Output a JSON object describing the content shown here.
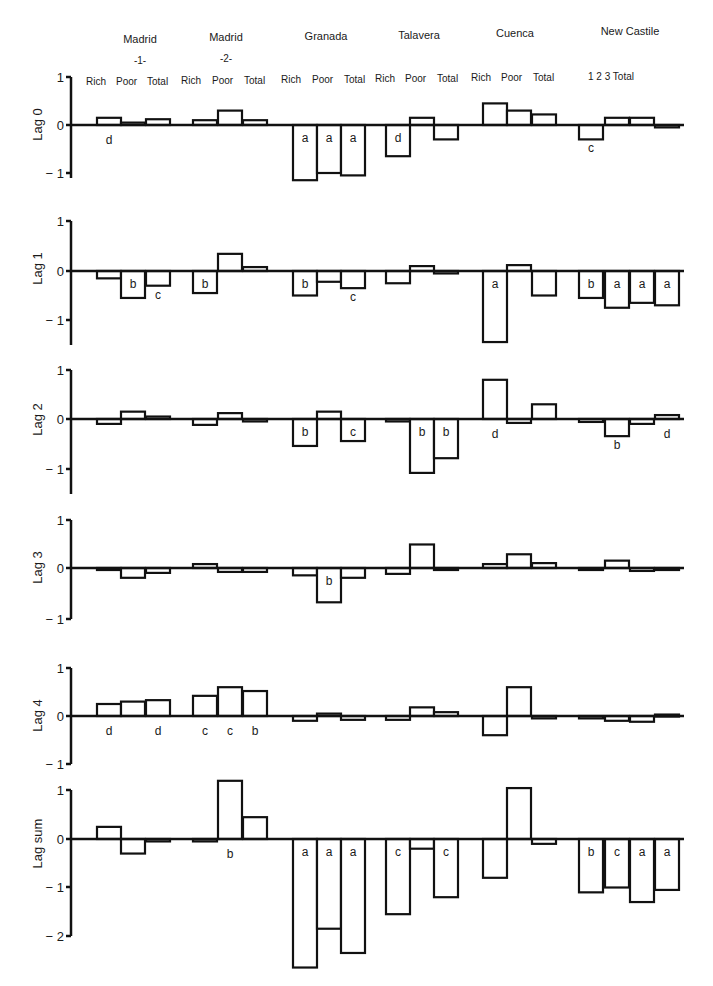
{
  "header": {
    "groups": [
      {
        "name": "Madrid",
        "sub": "-1-",
        "cols": [
          "Rich",
          "Poor",
          "Total"
        ]
      },
      {
        "name": "Madrid",
        "sub": "-2-",
        "cols": [
          "Rich",
          "Poor",
          "Total"
        ]
      },
      {
        "name": "Granada",
        "sub": "",
        "cols": [
          "Rich",
          "Poor",
          "Total"
        ]
      },
      {
        "name": "Talavera",
        "sub": "",
        "cols": [
          "Rich",
          "Poor",
          "Total"
        ]
      },
      {
        "name": "Cuenca",
        "sub": "",
        "cols": [
          "Rich",
          "Poor",
          "Total"
        ]
      },
      {
        "name": "New Castile",
        "sub": "",
        "cols_label": "1  2  3  Total"
      }
    ]
  },
  "chart_data": {
    "type": "bar",
    "title": "",
    "xlabel": "",
    "categories": [
      "Madrid-1 Rich",
      "Madrid-1 Poor",
      "Madrid-1 Total",
      "Madrid-2 Rich",
      "Madrid-2 Poor",
      "Madrid-2 Total",
      "Granada Rich",
      "Granada Poor",
      "Granada Total",
      "Talavera Rich",
      "Talavera Poor",
      "Talavera Total",
      "Cuenca Rich",
      "Cuenca Poor",
      "Cuenca Total",
      "New Castile 1",
      "New Castile 2",
      "New Castile 3",
      "New Castile Total"
    ],
    "panels": [
      {
        "ylabel": "Lag 0",
        "ylim": [
          -1.2,
          1
        ],
        "ticks": [
          "1",
          "0",
          "− 1"
        ],
        "values": [
          0.15,
          0.05,
          0.12,
          0.1,
          0.3,
          0.1,
          -1.15,
          -1.0,
          -1.05,
          -0.65,
          0.15,
          -0.3,
          0.45,
          0.3,
          0.22,
          -0.3,
          0.15,
          0.15,
          -0.05
        ],
        "sig": [
          "d",
          "",
          "",
          "",
          "",
          "",
          "a",
          "a",
          "a",
          "d",
          "",
          "",
          "",
          "",
          "",
          "c",
          "",
          "",
          ""
        ]
      },
      {
        "ylabel": "Lag 1",
        "ylim": [
          -1.5,
          1
        ],
        "ticks": [
          "1",
          "0",
          "− 1"
        ],
        "values": [
          -0.15,
          -0.55,
          -0.3,
          -0.45,
          0.35,
          0.08,
          -0.5,
          -0.22,
          -0.35,
          -0.25,
          0.1,
          -0.05,
          -1.45,
          0.12,
          -0.5,
          -0.55,
          -0.75,
          -0.65,
          -0.7
        ],
        "sig": [
          "",
          "b",
          "c",
          "b",
          "",
          "",
          "b",
          "",
          "c",
          "",
          "",
          "",
          "a",
          "",
          "",
          "b",
          "a",
          "a",
          "a"
        ]
      },
      {
        "ylabel": "Lag 2",
        "ylim": [
          -1.5,
          1
        ],
        "ticks": [
          "1",
          "0",
          "− 1"
        ],
        "values": [
          -0.1,
          0.15,
          0.05,
          -0.12,
          0.12,
          -0.05,
          -0.55,
          0.15,
          -0.45,
          -0.05,
          -1.1,
          -0.8,
          0.8,
          -0.08,
          0.3,
          -0.06,
          -0.35,
          -0.1,
          0.08
        ],
        "sig": [
          "",
          "",
          "",
          "",
          "",
          "",
          "b",
          "",
          "c",
          "",
          "b",
          "b",
          "d",
          "",
          "",
          "",
          "b",
          "",
          "d"
        ]
      },
      {
        "ylabel": "Lag 3",
        "ylim": [
          -1,
          1
        ],
        "ticks": [
          "1",
          "0",
          "− 1"
        ],
        "values": [
          0.0,
          -0.2,
          -0.1,
          0.08,
          -0.08,
          -0.08,
          -0.15,
          -0.7,
          -0.2,
          -0.12,
          0.48,
          0.0,
          0.08,
          0.28,
          0.1,
          0.0,
          0.15,
          -0.06,
          0.0
        ],
        "sig": [
          "",
          "",
          "",
          "",
          "",
          "",
          "",
          "b",
          "",
          "",
          "",
          "",
          "",
          "",
          "",
          "",
          "",
          "",
          ""
        ]
      },
      {
        "ylabel": "Lag 4",
        "ylim": [
          -1,
          1
        ],
        "ticks": [
          "1",
          "0",
          "− 1"
        ],
        "values": [
          0.25,
          0.3,
          0.33,
          0.42,
          0.6,
          0.52,
          -0.1,
          0.05,
          -0.08,
          -0.08,
          0.18,
          0.08,
          -0.4,
          0.6,
          -0.05,
          -0.05,
          -0.1,
          -0.12,
          0.03
        ],
        "sig": [
          "d",
          "",
          "d",
          "c",
          "c",
          "b",
          "",
          "",
          "",
          "",
          "",
          "",
          "",
          "",
          "",
          "",
          "",
          "",
          ""
        ]
      },
      {
        "ylabel": "Lag sum",
        "ylim": [
          -2.7,
          1.2
        ],
        "ticks": [
          "1",
          "0",
          "− 1",
          "− 2"
        ],
        "values": [
          0.25,
          -0.3,
          -0.05,
          -0.05,
          1.2,
          0.45,
          -2.65,
          -1.85,
          -2.35,
          -1.55,
          -0.2,
          -1.2,
          -0.8,
          1.05,
          -0.1,
          -1.1,
          -1.0,
          -1.3,
          -1.05
        ],
        "sig": [
          "",
          "",
          "",
          "",
          "b",
          "",
          "a",
          "a",
          "a",
          "c",
          "",
          "c",
          "",
          "",
          "",
          "b",
          "c",
          "a",
          "a"
        ]
      }
    ],
    "legend": "none",
    "grid": false
  }
}
